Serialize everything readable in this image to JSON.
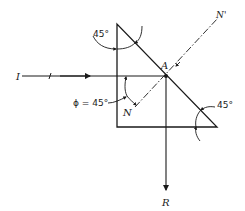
{
  "diagram": {
    "type": "optics-ray-diagram",
    "colors": {
      "ink": "#1a1a1a",
      "background": "#ffffff"
    },
    "labels": {
      "incident_ray": "I",
      "reflected_ray": "R",
      "point": "A",
      "normal_lower": "N",
      "normal_upper": "N'",
      "top_angle": "45°",
      "right_angle": "45°",
      "incidence_angle": "ϕ = 45°"
    },
    "elements": [
      {
        "id": "prism",
        "shape": "right-triangle",
        "vertices": [
          [
            117,
            24
          ],
          [
            117,
            127
          ],
          [
            217,
            127
          ]
        ]
      },
      {
        "id": "incident-ray",
        "from": [
          22,
          76
        ],
        "to": [
          166,
          76
        ],
        "label": "I"
      },
      {
        "id": "reflected-ray",
        "from": [
          166,
          76
        ],
        "to": [
          166,
          190
        ],
        "label": "R"
      },
      {
        "id": "normal",
        "style": "dash-dot",
        "from": [
          135,
          107
        ],
        "to": [
          218,
          18
        ],
        "labels": [
          "N",
          "N'"
        ]
      },
      {
        "id": "point-A",
        "at": [
          166,
          76
        ],
        "label": "A"
      }
    ]
  }
}
